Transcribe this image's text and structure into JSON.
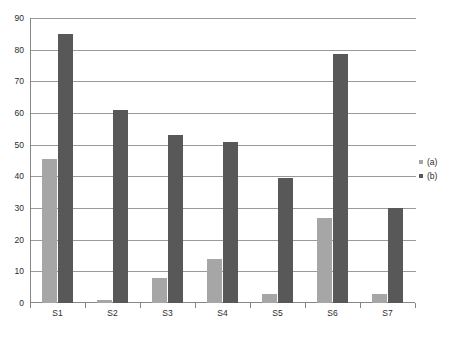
{
  "chart_data": {
    "type": "bar",
    "title": "",
    "xlabel": "",
    "ylabel": "",
    "categories": [
      "S1",
      "S2",
      "S3",
      "S4",
      "S5",
      "S6",
      "S7"
    ],
    "series": [
      {
        "name": "(a)",
        "color": "#a6a6a6",
        "values": [
          45.5,
          1.0,
          8.0,
          14.0,
          3.0,
          27.0,
          2.7
        ]
      },
      {
        "name": "(b)",
        "color": "#585858",
        "values": [
          85.0,
          61.0,
          53.0,
          51.0,
          39.5,
          78.5,
          30.0
        ]
      }
    ],
    "ylim": [
      0,
      90
    ],
    "y_ticks": [
      0,
      10,
      20,
      30,
      40,
      50,
      60,
      70,
      80,
      90
    ],
    "y_tick_labels": [
      "0",
      "10",
      "20",
      "30",
      "40",
      "50",
      "60",
      "70",
      "80",
      "90"
    ],
    "grid": true,
    "grid_axis": "y",
    "legend_position": "right",
    "legend": [
      {
        "marker": "square",
        "label": "(a)",
        "color": "#a6a6a6"
      },
      {
        "marker": "square",
        "label": "(b)",
        "color": "#585858"
      }
    ],
    "background_color": "#ffffff",
    "axis_color": "#868686",
    "gridline_color": "#9a9a9a",
    "text_color": "#2b2b2b"
  }
}
